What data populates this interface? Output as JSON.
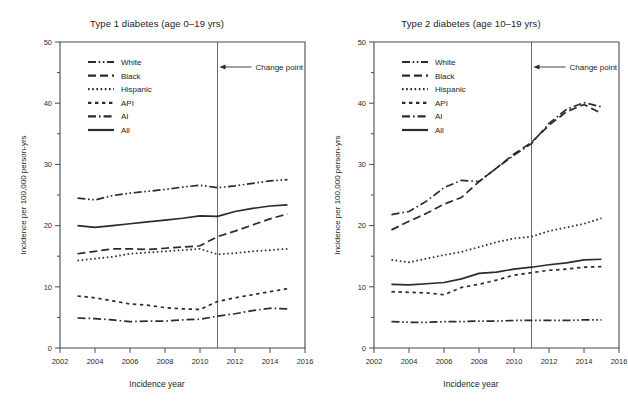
{
  "figure": {
    "background": "#ffffff",
    "line_color": "#2b2b2b",
    "axis_color": "#4a4a4a"
  },
  "axis_labels": {
    "x": "Incidence year",
    "y": "Incidence per 100,000 person-yrs"
  },
  "annotation": {
    "change_point_label": "Change point"
  },
  "legend": {
    "entries": [
      {
        "label": "White",
        "style": "dash-dot-dot"
      },
      {
        "label": "Black",
        "style": "long-dash"
      },
      {
        "label": "Hispanic",
        "style": "dotted"
      },
      {
        "label": "API",
        "style": "short-dash"
      },
      {
        "label": "AI",
        "style": "dash-dot"
      },
      {
        "label": "All",
        "style": "solid"
      }
    ]
  },
  "chart_data": [
    {
      "type": "line",
      "panel": "left",
      "title": "Type 1 diabetes (age 0–19 yrs)",
      "xlabel": "Incidence year",
      "ylabel": "Incidence per 100,000 person-yrs",
      "xlim": [
        2002,
        2016
      ],
      "ylim": [
        0,
        50
      ],
      "xticks": [
        2002,
        2004,
        2006,
        2008,
        2010,
        2012,
        2014,
        2016
      ],
      "yticks": [
        0,
        10,
        20,
        30,
        40,
        50
      ],
      "yticks_minor": [
        5,
        15,
        25,
        35,
        45
      ],
      "grid": false,
      "legend_position": "upper-left",
      "change_point_x": 2011,
      "x": [
        2003,
        2004,
        2005,
        2006,
        2007,
        2008,
        2009,
        2010,
        2011,
        2012,
        2013,
        2014,
        2015
      ],
      "series": [
        {
          "name": "White",
          "style": "dash-dot-dot",
          "values": [
            24.5,
            24.2,
            24.9,
            25.3,
            25.6,
            25.9,
            26.3,
            26.6,
            26.2,
            26.5,
            26.9,
            27.3,
            27.5
          ]
        },
        {
          "name": "Black",
          "style": "long-dash",
          "values": [
            15.4,
            15.8,
            16.2,
            16.2,
            16.1,
            16.3,
            16.5,
            16.7,
            18.2,
            19.1,
            20.1,
            21.1,
            21.9
          ]
        },
        {
          "name": "Hispanic",
          "style": "dotted",
          "values": [
            14.3,
            14.6,
            14.9,
            15.4,
            15.6,
            15.8,
            16.0,
            16.2,
            15.3,
            15.5,
            15.8,
            16.0,
            16.2
          ]
        },
        {
          "name": "API",
          "style": "short-dash",
          "values": [
            8.5,
            8.2,
            7.7,
            7.2,
            7.0,
            6.6,
            6.4,
            6.3,
            7.6,
            8.2,
            8.7,
            9.2,
            9.7
          ]
        },
        {
          "name": "AI",
          "style": "dash-dot",
          "values": [
            4.9,
            4.8,
            4.6,
            4.3,
            4.4,
            4.4,
            4.6,
            4.7,
            5.2,
            5.6,
            6.1,
            6.5,
            6.4
          ]
        },
        {
          "name": "All",
          "style": "solid",
          "values": [
            20.0,
            19.7,
            20.0,
            20.3,
            20.6,
            20.9,
            21.2,
            21.6,
            21.5,
            22.3,
            22.8,
            23.2,
            23.4
          ]
        }
      ]
    },
    {
      "type": "line",
      "panel": "right",
      "title": "Type 2 diabetes (age 10–19 yrs)",
      "xlabel": "Incidence year",
      "ylabel": "Incidence per 100,000 person-yrs",
      "xlim": [
        2002,
        2016
      ],
      "ylim": [
        0,
        50
      ],
      "xticks": [
        2002,
        2004,
        2006,
        2008,
        2010,
        2012,
        2014,
        2016
      ],
      "yticks": [
        0,
        10,
        20,
        30,
        40,
        50
      ],
      "yticks_minor": [
        5,
        15,
        25,
        35,
        45
      ],
      "grid": false,
      "legend_position": "upper-left",
      "change_point_x": 2011,
      "x": [
        2003,
        2004,
        2005,
        2006,
        2007,
        2008,
        2009,
        2010,
        2011,
        2012,
        2013,
        2014,
        2015
      ],
      "series": [
        {
          "name": "White",
          "style": "dash-dot-dot",
          "values": [
            4.3,
            4.2,
            4.2,
            4.3,
            4.3,
            4.4,
            4.4,
            4.5,
            4.5,
            4.5,
            4.5,
            4.6,
            4.6
          ]
        },
        {
          "name": "Black",
          "style": "long-dash",
          "values": [
            19.3,
            20.7,
            22.0,
            23.5,
            24.6,
            27.2,
            29.4,
            31.7,
            33.6,
            36.4,
            38.6,
            39.8,
            38.3
          ]
        },
        {
          "name": "Hispanic",
          "style": "dotted",
          "values": [
            14.4,
            14.0,
            14.6,
            15.2,
            15.7,
            16.5,
            17.3,
            17.9,
            18.2,
            19.1,
            19.7,
            20.3,
            21.2
          ]
        },
        {
          "name": "API",
          "style": "short-dash",
          "values": [
            9.2,
            9.1,
            9.0,
            8.7,
            9.9,
            10.4,
            11.1,
            11.9,
            12.3,
            12.7,
            12.9,
            13.2,
            13.3
          ]
        },
        {
          "name": "AI",
          "style": "dash-dot",
          "values": [
            21.8,
            22.3,
            24.0,
            26.2,
            27.4,
            27.2,
            29.4,
            31.5,
            33.4,
            36.7,
            39.0,
            40.1,
            39.4
          ]
        },
        {
          "name": "All",
          "style": "solid",
          "values": [
            10.4,
            10.3,
            10.5,
            10.7,
            11.3,
            12.2,
            12.4,
            12.9,
            13.2,
            13.6,
            13.9,
            14.4,
            14.5
          ]
        }
      ]
    }
  ]
}
